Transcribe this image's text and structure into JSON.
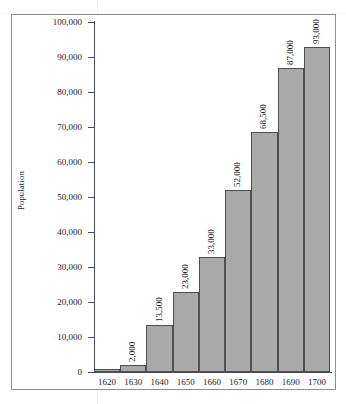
{
  "chart_data": {
    "type": "bar",
    "title": "",
    "xlabel": "",
    "ylabel": "Population",
    "categories": [
      "1620",
      "1630",
      "1640",
      "1650",
      "1660",
      "1670",
      "1680",
      "1690",
      "1700"
    ],
    "values": [
      1000,
      2000,
      13500,
      23000,
      33000,
      52000,
      68500,
      87000,
      93000
    ],
    "data_labels": [
      "",
      "2,000",
      "13,500",
      "23,000",
      "33,000",
      "52,000",
      "68,500",
      "87,000",
      "93,000"
    ],
    "ylim": [
      0,
      100000
    ],
    "y_ticks": [
      0,
      10000,
      20000,
      30000,
      40000,
      50000,
      60000,
      70000,
      80000,
      90000,
      100000
    ],
    "y_tick_labels": [
      "0",
      "10,000",
      "20,000",
      "30,000",
      "40,000",
      "50,000",
      "60,000",
      "70,000",
      "80,000",
      "90,000",
      "100,000"
    ],
    "grid": false,
    "legend": false,
    "legend_position": "none",
    "bar_style": "contiguous",
    "data_label_orientation": "vertical",
    "colors": {
      "bar_fill": "#a9a9a9",
      "bar_outline": "#4e4e54",
      "axis": "#4a4a52",
      "text": "#1d1d26",
      "frame": "#8e8e8e",
      "background": "#ffffff"
    }
  },
  "axes": {
    "y_title": "Population"
  }
}
